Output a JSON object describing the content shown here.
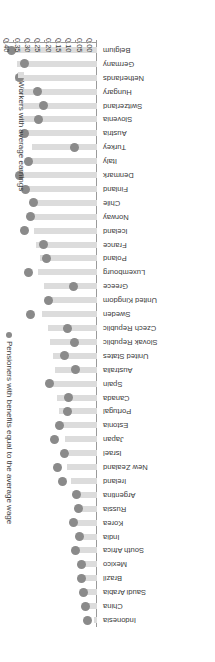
{
  "chart_data": {
    "type": "bar",
    "title": "",
    "subtitle": "",
    "xlabel": "",
    "ylabel": "",
    "orientation": "horizontal",
    "xlim": [
      0.0,
      0.45
    ],
    "grid": false,
    "legend_position": "right",
    "tick_labels": [
      "0.00",
      "0.05",
      "0.10",
      "0.15",
      "0.20",
      "0.25",
      "0.30",
      "0.35",
      "0.40",
      "0.45"
    ],
    "tick_values": [
      0.0,
      0.05,
      0.1,
      0.15,
      0.2,
      0.25,
      0.3,
      0.35,
      0.4,
      0.45
    ],
    "categories": [
      "Indonesia",
      "China",
      "Saudi Arabia",
      "Brazil",
      "Mexico",
      "South Africa",
      "India",
      "Korea",
      "Russia",
      "Argentina",
      "Ireland",
      "New Zealand",
      "Israel",
      "Japan",
      "Estonia",
      "Portugal",
      "Canada",
      "Spain",
      "Australia",
      "United States",
      "Slovak Republic",
      "Czech Republic",
      "Sweden",
      "United Kingdom",
      "Greece",
      "Luxembourg",
      "Poland",
      "France",
      "Iceland",
      "Norway",
      "Chile",
      "Finland",
      "Denmark",
      "Italy",
      "Turkey",
      "Austria",
      "Slovenia",
      "Switzerland",
      "Hungary",
      "Netherlands",
      "Germany",
      "Belgium"
    ],
    "series": [
      {
        "name": "Workers with average earnings",
        "marker": "bar",
        "color": "#dcdcdc",
        "values": [
          0.015,
          0.055,
          0.065,
          0.075,
          0.075,
          0.085,
          0.085,
          0.095,
          0.095,
          0.105,
          0.125,
          0.145,
          0.135,
          0.155,
          0.165,
          0.185,
          0.195,
          0.215,
          0.205,
          0.215,
          0.225,
          0.235,
          0.265,
          0.245,
          0.255,
          0.285,
          0.275,
          0.295,
          0.305,
          0.315,
          0.305,
          0.335,
          0.355,
          0.345,
          0.315,
          0.365,
          0.375,
          0.365,
          0.375,
          0.395,
          0.385,
          0.425
        ]
      },
      {
        "name": "Pensioners with benefits equal to the average wage",
        "marker": "dot",
        "color": "#8a8a8a",
        "values": [
          0.045,
          0.055,
          0.065,
          0.075,
          0.075,
          0.105,
          0.085,
          0.115,
          0.09,
          0.1,
          0.165,
          0.19,
          0.155,
          0.205,
          0.18,
          0.145,
          0.14,
          0.23,
          0.105,
          0.155,
          0.11,
          0.145,
          0.32,
          0.235,
          0.115,
          0.33,
          0.245,
          0.26,
          0.35,
          0.32,
          0.305,
          0.345,
          0.375,
          0.33,
          0.11,
          0.35,
          0.285,
          0.26,
          0.29,
          0.375,
          0.35,
          0.415
        ]
      }
    ],
    "legend": [
      {
        "label": "Pensioners with benefits equal to the average wage",
        "marker": "dot",
        "color": "#8a8a8a"
      },
      {
        "label": "Workers with average earnings",
        "marker": "square",
        "color": "#dcdcdc"
      }
    ]
  }
}
